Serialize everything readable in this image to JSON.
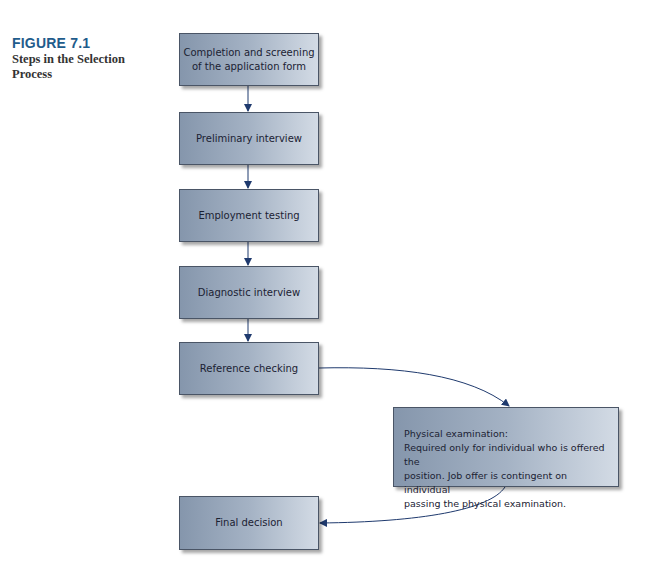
{
  "figure": {
    "label": "FIGURE 7.1",
    "title": "Steps in the Selection Process"
  },
  "steps": [
    {
      "line1": "Completion and screening",
      "line2": "of the application form"
    },
    {
      "label": "Preliminary interview"
    },
    {
      "label": "Employment testing"
    },
    {
      "label": "Diagnostic interview"
    },
    {
      "label": "Reference checking"
    },
    {
      "heading": "Physical examination:",
      "line1": "Required only for individual who is offered the",
      "line2": "position. Job offer is contingent on individual",
      "line3": "passing the physical examination."
    },
    {
      "label": "Final decision"
    }
  ],
  "colors": {
    "arrow": "#1f3a6e",
    "figure_label": "#1f5c8c"
  }
}
